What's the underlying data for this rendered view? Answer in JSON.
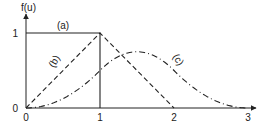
{
  "chart_data": {
    "type": "line",
    "title": "",
    "xlabel": "",
    "ylabel": "f(u)",
    "xlim": [
      0,
      3
    ],
    "ylim": [
      0,
      1
    ],
    "x_ticks": [
      "0",
      "1",
      "2",
      "3"
    ],
    "y_ticks": [
      "0",
      "1"
    ],
    "grid": false,
    "series": [
      {
        "name": "(a)",
        "style": "solid",
        "points": [
          [
            0,
            1
          ],
          [
            1,
            1
          ],
          [
            1,
            0
          ]
        ]
      },
      {
        "name": "(b)",
        "style": "dashed",
        "points": [
          [
            0,
            0
          ],
          [
            1,
            1
          ],
          [
            2,
            0
          ]
        ]
      },
      {
        "name": "(c)",
        "style": "dash-dot",
        "function": "quadratic B-spline",
        "points": [
          [
            0,
            0
          ],
          [
            0.5,
            0.125
          ],
          [
            1,
            0.5
          ],
          [
            1.5,
            0.75
          ],
          [
            2,
            0.5
          ],
          [
            2.5,
            0.125
          ],
          [
            3,
            0
          ]
        ]
      }
    ]
  }
}
